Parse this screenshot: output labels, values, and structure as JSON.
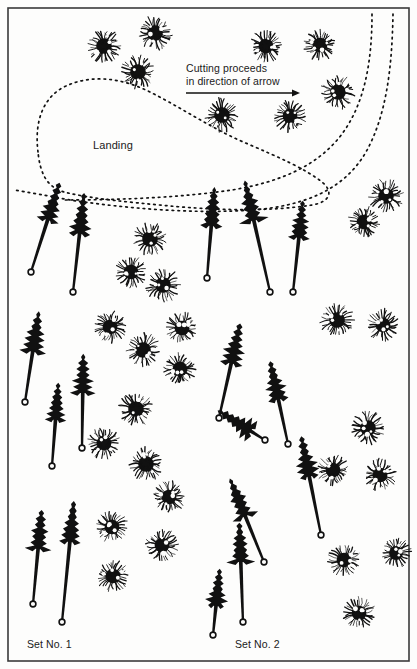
{
  "figure": {
    "kind": "forestry-felling-pattern-diagram",
    "background_color": "#fdfdfc",
    "ink_color": "#111111",
    "border": {
      "color": "#3a3a3a",
      "width_px": 1.6,
      "inset_px": 8
    }
  },
  "labels": {
    "landing": "Landing",
    "cutting_line1": "Cutting proceeds",
    "cutting_line2": "in direction of arrow",
    "set_1": "Set No. 1",
    "set_2": "Set No. 2"
  },
  "arrow": {
    "name": "cutting-direction-arrow",
    "x1": 186,
    "y1": 93,
    "x2": 300,
    "y2": 93,
    "head_size": 7,
    "color": "#111111"
  },
  "dotted_paths": [
    {
      "name": "landing-boundary",
      "desc": "closed dotted loop enclosing the landing area",
      "d": "M 38 152 C 34 120 44 96 66 86 C 92 74 122 78 150 92 C 182 108 214 130 248 144 C 278 157 304 168 322 182 C 334 192 330 202 312 205 C 268 212 214 210 170 206 C 128 202 92 199 64 192 C 46 187 40 172 38 152 Z",
      "dash": "1.6 4.2",
      "width": 1.7
    },
    {
      "name": "road-curve-outer",
      "desc": "dotted road sweeping from top-right down and to the left",
      "d": "M 393 14 C 392 70 386 116 366 152 C 344 190 304 206 252 210 C 196 214 130 209 70 200 C 48 196 28 192 14 190",
      "dash": "1.6 4.2",
      "width": 1.7
    },
    {
      "name": "road-curve-inner",
      "desc": "second dotted road curve, inner, ending lower-left",
      "d": "M 372 14 C 372 64 364 104 342 134 C 318 166 280 182 232 190 C 178 198 116 200 62 200",
      "dash": "1.6 4.2",
      "width": 1.7
    }
  ],
  "standing_trees": [
    {
      "x": 104,
      "y": 46,
      "r": 17
    },
    {
      "x": 155,
      "y": 33,
      "r": 17
    },
    {
      "x": 138,
      "y": 72,
      "r": 17
    },
    {
      "x": 266,
      "y": 46,
      "r": 16
    },
    {
      "x": 320,
      "y": 45,
      "r": 16
    },
    {
      "x": 338,
      "y": 92,
      "r": 17
    },
    {
      "x": 222,
      "y": 115,
      "r": 17
    },
    {
      "x": 290,
      "y": 116,
      "r": 16
    },
    {
      "x": 386,
      "y": 196,
      "r": 17
    },
    {
      "x": 150,
      "y": 239,
      "r": 17
    },
    {
      "x": 131,
      "y": 272,
      "r": 16
    },
    {
      "x": 163,
      "y": 285,
      "r": 17
    },
    {
      "x": 364,
      "y": 222,
      "r": 16
    },
    {
      "x": 110,
      "y": 327,
      "r": 16
    },
    {
      "x": 143,
      "y": 350,
      "r": 17
    },
    {
      "x": 180,
      "y": 369,
      "r": 16
    },
    {
      "x": 136,
      "y": 409,
      "r": 17
    },
    {
      "x": 337,
      "y": 320,
      "r": 17
    },
    {
      "x": 383,
      "y": 325,
      "r": 16
    },
    {
      "x": 182,
      "y": 328,
      "r": 16
    },
    {
      "x": 104,
      "y": 443,
      "r": 16
    },
    {
      "x": 146,
      "y": 464,
      "r": 17
    },
    {
      "x": 368,
      "y": 428,
      "r": 17
    },
    {
      "x": 169,
      "y": 497,
      "r": 16
    },
    {
      "x": 112,
      "y": 527,
      "r": 16
    },
    {
      "x": 333,
      "y": 470,
      "r": 16
    },
    {
      "x": 380,
      "y": 475,
      "r": 16
    },
    {
      "x": 344,
      "y": 560,
      "r": 16
    },
    {
      "x": 113,
      "y": 576,
      "r": 16
    },
    {
      "x": 162,
      "y": 545,
      "r": 16
    },
    {
      "x": 359,
      "y": 613,
      "r": 16
    },
    {
      "x": 396,
      "y": 553,
      "r": 15
    },
    {
      "x": 205,
      "y": 436,
      "r": 0
    }
  ],
  "felled_trees": [
    {
      "crown_x": 54,
      "crown_y": 200,
      "stump_x": 31,
      "stump_y": 272,
      "crown_h": 42,
      "crown_w": 23
    },
    {
      "crown_x": 82,
      "crown_y": 212,
      "stump_x": 73,
      "stump_y": 292,
      "crown_h": 44,
      "crown_w": 23
    },
    {
      "crown_x": 213,
      "crown_y": 205,
      "stump_x": 207,
      "stump_y": 278,
      "crown_h": 42,
      "crown_w": 22
    },
    {
      "crown_x": 249,
      "crown_y": 199,
      "stump_x": 270,
      "stump_y": 292,
      "crown_h": 44,
      "crown_w": 24
    },
    {
      "crown_x": 301,
      "crown_y": 218,
      "stump_x": 293,
      "stump_y": 292,
      "crown_h": 40,
      "crown_w": 22
    },
    {
      "crown_x": 36,
      "crown_y": 330,
      "stump_x": 25,
      "stump_y": 402,
      "crown_h": 44,
      "crown_w": 24
    },
    {
      "crown_x": 57,
      "crown_y": 400,
      "stump_x": 52,
      "stump_y": 466,
      "crown_h": 40,
      "crown_w": 22
    },
    {
      "crown_x": 83,
      "crown_y": 372,
      "stump_x": 82,
      "stump_y": 448,
      "crown_h": 42,
      "crown_w": 23
    },
    {
      "crown_x": 236,
      "crown_y": 342,
      "stump_x": 219,
      "stump_y": 418,
      "crown_h": 44,
      "crown_w": 24
    },
    {
      "crown_x": 274,
      "crown_y": 379,
      "stump_x": 288,
      "stump_y": 444,
      "crown_h": 42,
      "crown_w": 23
    },
    {
      "crown_x": 233,
      "crown_y": 420,
      "stump_x": 265,
      "stump_y": 440,
      "crown_h": 42,
      "crown_w": 23
    },
    {
      "crown_x": 305,
      "crown_y": 455,
      "stump_x": 321,
      "stump_y": 535,
      "crown_h": 44,
      "crown_w": 24
    },
    {
      "crown_x": 237,
      "crown_y": 496,
      "stump_x": 264,
      "stump_y": 562,
      "crown_h": 44,
      "crown_w": 24
    },
    {
      "crown_x": 40,
      "crown_y": 528,
      "stump_x": 33,
      "stump_y": 604,
      "crown_h": 42,
      "crown_w": 23
    },
    {
      "crown_x": 72,
      "crown_y": 520,
      "stump_x": 62,
      "stump_y": 622,
      "crown_h": 44,
      "crown_w": 24
    },
    {
      "crown_x": 240,
      "crown_y": 541,
      "stump_x": 243,
      "stump_y": 622,
      "crown_h": 42,
      "crown_w": 23
    },
    {
      "crown_x": 218,
      "crown_y": 586,
      "stump_x": 213,
      "stump_y": 635,
      "crown_h": 40,
      "crown_w": 22
    }
  ]
}
